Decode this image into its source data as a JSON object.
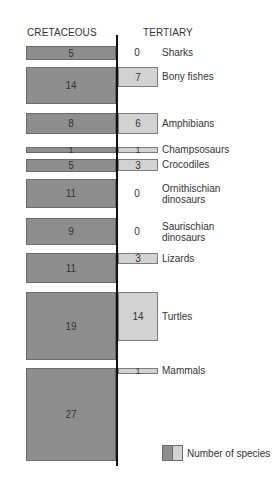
{
  "chart_data": {
    "type": "bar",
    "orientation": "horizontal-back-to-back",
    "title": "",
    "series": [
      {
        "name": "CRETACEOUS",
        "side": "left",
        "color": "#8e8e8e",
        "values": [
          5,
          14,
          8,
          1,
          5,
          11,
          9,
          11,
          19,
          27
        ]
      },
      {
        "name": "TERTIARY",
        "side": "right",
        "color": "#d2d2d2",
        "values": [
          0,
          7,
          6,
          1,
          3,
          0,
          0,
          3,
          14,
          1
        ]
      }
    ],
    "categories": [
      "Sharks",
      "Bony fishes",
      "Amphibians",
      "Champsosaurs",
      "Crocodiles",
      "Ornithischian dinosaurs",
      "Saurischian dinosaurs",
      "Lizards",
      "Turtles",
      "Mammals"
    ],
    "legend": {
      "label": "Number of species",
      "position": "bottom-right"
    },
    "encoding": "bar height proportional to number of species; fixed widths per side",
    "grid": false
  },
  "headers": {
    "left": "CRETACEOUS",
    "right": "TERTIARY"
  },
  "rows": [
    {
      "label": "Sharks",
      "cret": "5",
      "tert": "0",
      "top": 46,
      "cret_h": 14,
      "tert_h": 0
    },
    {
      "label": "Bony fishes",
      "cret": "14",
      "tert": "7",
      "top": 67,
      "cret_h": 37,
      "tert_h": 20
    },
    {
      "label": "Amphibians",
      "cret": "8",
      "tert": "6",
      "top": 113,
      "cret_h": 21,
      "tert_h": 21
    },
    {
      "label": "Champsosaurs",
      "cret": "1",
      "tert": "1",
      "top": 147,
      "cret_h": 6,
      "tert_h": 6
    },
    {
      "label": "Crocodiles",
      "cret": "5",
      "tert": "3",
      "top": 159,
      "cret_h": 13,
      "tert_h": 12
    },
    {
      "label": "Ornithischian\ndinosaurs",
      "cret": "11",
      "tert": "0",
      "top": 179,
      "cret_h": 29,
      "tert_h": 0
    },
    {
      "label": "Saurischian\ndinosaurs",
      "cret": "9",
      "tert": "0",
      "top": 218,
      "cret_h": 27,
      "tert_h": 0
    },
    {
      "label": "Lizards",
      "cret": "11",
      "tert": "3",
      "top": 253,
      "cret_h": 30,
      "tert_h": 11
    },
    {
      "label": "Turtles",
      "cret": "19",
      "tert": "14",
      "top": 292,
      "cret_h": 68,
      "tert_h": 49
    },
    {
      "label": "Mammals",
      "cret": "27",
      "tert": "1",
      "top": 368,
      "cret_h": 93,
      "tert_h": 6
    }
  ],
  "legend": {
    "label": "Number of species"
  }
}
